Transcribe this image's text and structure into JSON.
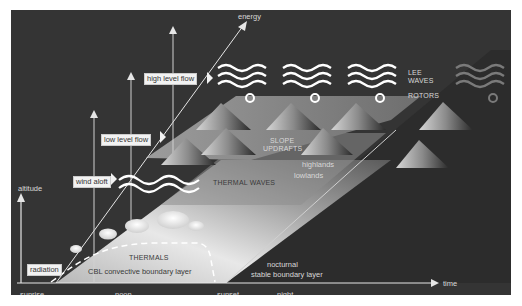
{
  "diagram": {
    "axes": {
      "x_label": "time",
      "y_label": "altitude",
      "diagonal_label": "energy",
      "x_ticks": [
        "sunrise",
        "noon",
        "sunset",
        "night"
      ]
    },
    "flow_tags": {
      "radiation": "radiation",
      "wind_aloft": "wind aloft",
      "low_level_flow": "low level flow",
      "high_level_flow": "high level flow"
    },
    "labels": {
      "thermals": "THERMALS",
      "cbl": "CBL convective boundary layer",
      "thermal_waves": "THERMAL WAVES",
      "slope_updrafts_1": "SLOPE",
      "slope_updrafts_2": "UPDRAFTS",
      "highlands": "highlands",
      "lowlands": "lowlands",
      "lee_waves_1": "LEE",
      "lee_waves_2": "WAVES",
      "rotors": "ROTORS",
      "nocturnal_1": "nocturnal",
      "nocturnal_2": "stable boundary layer"
    },
    "colors": {
      "background": "#343434",
      "plane_light": "#d9d9d9",
      "plane_mid": "#8f8f8f",
      "axis": "#e6e6e6"
    }
  }
}
